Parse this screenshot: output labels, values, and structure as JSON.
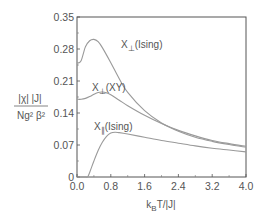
{
  "chart_data": {
    "type": "line",
    "title": "",
    "xlabel": "k_B T/|J|",
    "ylabel": "|χ| |J| / N g² β²",
    "xlim": [
      0.0,
      4.0
    ],
    "ylim": [
      0,
      0.35
    ],
    "x_ticks": [
      "0.0",
      "0.8",
      "1.6",
      "2.4",
      "3.2",
      "4.0"
    ],
    "y_ticks": [
      "0",
      "0.07",
      "0.14",
      "0.21",
      "0.28",
      "0.35"
    ],
    "grid": false,
    "legend": "inline annotations",
    "series": [
      {
        "name": "X⊥(Ising)",
        "x": [
          0.0,
          0.05,
          0.1,
          0.15,
          0.2,
          0.3,
          0.4,
          0.5,
          0.6,
          0.8,
          1.0,
          1.2,
          1.6,
          2.0,
          2.4,
          2.8,
          3.2,
          3.6,
          4.0
        ],
        "values": [
          0.25,
          0.25,
          0.255,
          0.27,
          0.285,
          0.298,
          0.301,
          0.296,
          0.283,
          0.25,
          0.215,
          0.185,
          0.145,
          0.118,
          0.1,
          0.087,
          0.078,
          0.071,
          0.065
        ]
      },
      {
        "name": "X⊥(XY)",
        "x": [
          0.0,
          0.1,
          0.2,
          0.3,
          0.4,
          0.5,
          0.6,
          0.7,
          0.8,
          1.0,
          1.2,
          1.6,
          2.0,
          2.4,
          2.8,
          3.2,
          3.6,
          4.0
        ],
        "values": [
          0.17,
          0.17,
          0.172,
          0.176,
          0.181,
          0.185,
          0.186,
          0.184,
          0.18,
          0.168,
          0.156,
          0.135,
          0.117,
          0.102,
          0.09,
          0.08,
          0.073,
          0.067
        ]
      },
      {
        "name": "X∥(Ising)",
        "x": [
          0.0,
          0.2,
          0.25,
          0.3,
          0.4,
          0.5,
          0.6,
          0.7,
          0.8,
          0.9,
          1.0,
          1.2,
          1.6,
          2.0,
          2.4,
          2.8,
          3.2,
          3.6,
          4.0
        ],
        "values": [
          0.0,
          0.0,
          0.0,
          0.01,
          0.035,
          0.058,
          0.076,
          0.089,
          0.096,
          0.098,
          0.097,
          0.094,
          0.087,
          0.08,
          0.074,
          0.068,
          0.063,
          0.059,
          0.055
        ]
      }
    ],
    "annotations": [
      {
        "text": "X⊥(Ising)",
        "x": 1.05,
        "y": 0.28
      },
      {
        "text": "X⊥(XY)",
        "x": 0.35,
        "y": 0.2
      },
      {
        "text": "X∥(Ising)",
        "x": 0.5,
        "y": 0.115
      }
    ]
  },
  "labels": {
    "ylabel_num": "|χ| |J|",
    "ylabel_den": "Ng² β²",
    "xlabel_k": "k",
    "xlabel_sub": "B",
    "xlabel_rest": "T/|J|",
    "ann_perp_ising_main": "X",
    "ann_perp_ising_sub": "⊥",
    "ann_perp_ising_tail": "(Ising)",
    "ann_perp_xy_main": "X",
    "ann_perp_xy_sub": "⊥",
    "ann_perp_xy_tail": "(XY)",
    "ann_par_ising_main": "X",
    "ann_par_ising_sub": "∥",
    "ann_par_ising_tail": "(Ising)"
  },
  "colors": {
    "curve": "#9a9a9a",
    "frame": "#555555",
    "text": "#555555"
  }
}
